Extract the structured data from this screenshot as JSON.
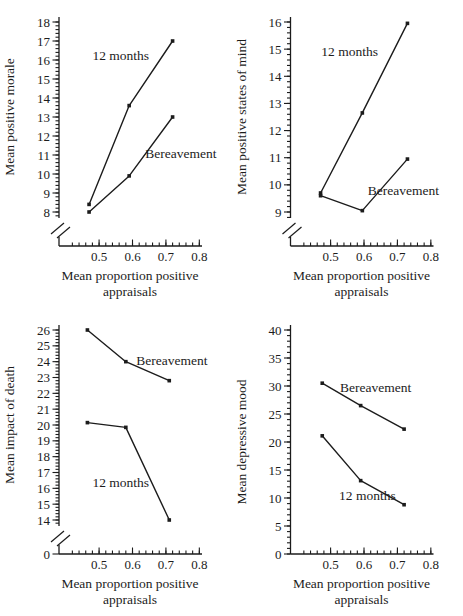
{
  "figure": {
    "background": "#ffffff",
    "ink_color": "#1c1c1c"
  },
  "chart_data": [
    {
      "id": "positive-morale",
      "type": "line",
      "title": "",
      "ylabel": "Mean positive morale",
      "xlabel_lines": [
        "Mean proportion positive",
        "appraisals"
      ],
      "xlim": [
        0.38,
        0.805
      ],
      "x_ticks": [
        0.5,
        0.6,
        0.7,
        0.8
      ],
      "x_minor_start": 0.42,
      "x_minor_step": 0.02,
      "ylim": [
        8,
        18
      ],
      "y_tick_step": 1,
      "y_minors_per_major": 4,
      "axis_break": true,
      "zero_label": false,
      "legend_position": "inline-labels",
      "grid": false,
      "series": [
        {
          "name": "12 months",
          "x": [
            0.47,
            0.59,
            0.72
          ],
          "y": [
            8.4,
            13.6,
            17.0
          ],
          "label": {
            "text": "12 months",
            "x": 0.565,
            "y": 16.25
          }
        },
        {
          "name": "Bereavement",
          "x": [
            0.47,
            0.59,
            0.72
          ],
          "y": [
            8.0,
            9.9,
            13.0
          ],
          "label": {
            "text": "Bereavement",
            "x": 0.745,
            "y": 11.1
          }
        }
      ]
    },
    {
      "id": "positive-states-of-mind",
      "type": "line",
      "title": "",
      "ylabel": "Mean positive states of mind",
      "xlabel_lines": [
        "Mean proportion positive",
        "appraisals"
      ],
      "xlim": [
        0.38,
        0.805
      ],
      "x_ticks": [
        0.5,
        0.6,
        0.7,
        0.8
      ],
      "x_minor_start": 0.42,
      "x_minor_step": 0.02,
      "ylim": [
        9,
        16
      ],
      "y_tick_step": 1,
      "y_minors_per_major": 4,
      "axis_break": true,
      "zero_label": false,
      "legend_position": "inline-labels",
      "grid": false,
      "series": [
        {
          "name": "12 months",
          "x": [
            0.47,
            0.595,
            0.73
          ],
          "y": [
            9.7,
            12.65,
            15.95
          ],
          "label": {
            "text": "12 months",
            "x": 0.557,
            "y": 14.9
          }
        },
        {
          "name": "Bereavement",
          "x": [
            0.47,
            0.595,
            0.73
          ],
          "y": [
            9.6,
            9.05,
            10.95
          ],
          "label": {
            "text": "Bereavement",
            "x": 0.718,
            "y": 9.78
          }
        }
      ]
    },
    {
      "id": "impact-of-death",
      "type": "line",
      "title": "",
      "ylabel": "Mean impact of death",
      "xlabel_lines": [
        "Mean proportion positive",
        "appraisals"
      ],
      "xlim": [
        0.38,
        0.805
      ],
      "x_ticks": [
        0.5,
        0.6,
        0.7,
        0.8
      ],
      "x_minor_start": 0.42,
      "x_minor_step": 0.02,
      "ylim": [
        14,
        26
      ],
      "y_tick_step": 1,
      "y_minors_per_major": 4,
      "axis_break": true,
      "zero_label": true,
      "zero_label_text": "0",
      "legend_position": "inline-labels",
      "grid": false,
      "series": [
        {
          "name": "Bereavement",
          "x": [
            0.465,
            0.58,
            0.71
          ],
          "y": [
            26.0,
            24.0,
            22.8
          ],
          "label": {
            "text": "Bereavement",
            "x": 0.718,
            "y": 24.05
          }
        },
        {
          "name": "12 months",
          "x": [
            0.465,
            0.58,
            0.71
          ],
          "y": [
            20.15,
            19.85,
            14.0
          ],
          "label": {
            "text": "12 months",
            "x": 0.565,
            "y": 16.35
          }
        }
      ]
    },
    {
      "id": "depressive-mood",
      "type": "line",
      "title": "",
      "ylabel": "Mean depressive mood",
      "xlabel_lines": [
        "Mean proportion positive",
        "appraisals"
      ],
      "xlim": [
        0.38,
        0.805
      ],
      "x_ticks": [
        0.5,
        0.6,
        0.7,
        0.8
      ],
      "x_minor_start": 0.42,
      "x_minor_step": 0.02,
      "ylim": [
        0,
        40
      ],
      "y_tick_step": 5,
      "y_minors_per_major": 4,
      "axis_break": false,
      "zero_label": false,
      "legend_position": "inline-labels",
      "grid": false,
      "series": [
        {
          "name": "Bereavement",
          "x": [
            0.475,
            0.59,
            0.72
          ],
          "y": [
            30.5,
            26.5,
            22.3
          ],
          "label": {
            "text": "Bereavement",
            "x": 0.635,
            "y": 29.8
          }
        },
        {
          "name": "12 months",
          "x": [
            0.475,
            0.59,
            0.72
          ],
          "y": [
            21.1,
            13.1,
            8.8
          ],
          "label": {
            "text": "12 months",
            "x": 0.61,
            "y": 10.4
          }
        }
      ]
    }
  ]
}
